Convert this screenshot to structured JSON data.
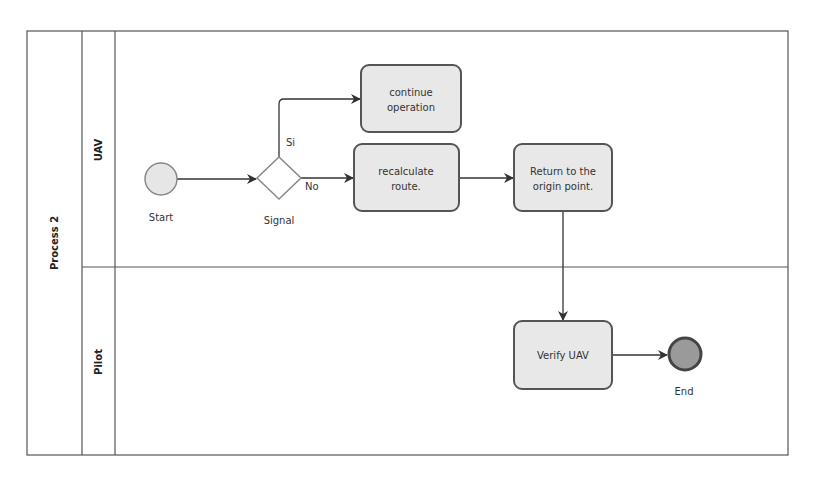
{
  "pool": {
    "label": "Process 2",
    "lanes": [
      {
        "label": "UAV"
      },
      {
        "label": "Pilot"
      }
    ]
  },
  "events": {
    "start": {
      "label": "Start"
    },
    "end": {
      "label": "End"
    }
  },
  "gateway": {
    "label": "Signal",
    "yes_label": "Si",
    "no_label": "No"
  },
  "tasks": {
    "continue_operation": {
      "line1": "continue",
      "line2": "operation"
    },
    "recalculate_route": {
      "line1": "recalculate",
      "line2": "route."
    },
    "return_origin": {
      "line1": "Return to the",
      "line2": "origin point."
    },
    "verify_uav": {
      "line1": "Verify UAV"
    }
  },
  "colors": {
    "border": "#555555",
    "task_fill": "#e8e8e8",
    "task_stroke": "#555555",
    "start_fill": "#e6e6e6",
    "start_stroke": "#888888",
    "end_fill": "#9a9a9a",
    "end_stroke": "#444444",
    "arrow": "#333333"
  }
}
